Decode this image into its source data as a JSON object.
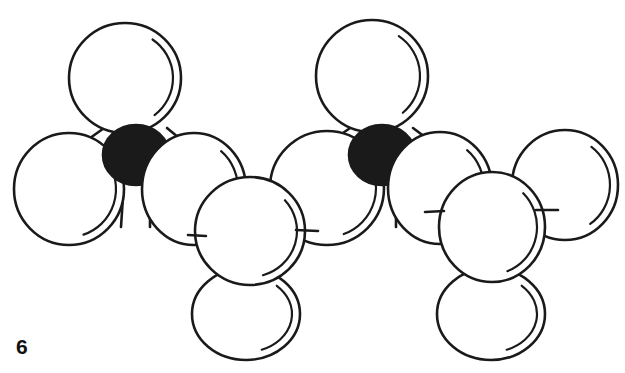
{
  "figure": {
    "label": "6",
    "caption": "",
    "background_color": "#ffffff",
    "outline_color": "#1a1a1a",
    "sphere_fill_color": "#ffffff",
    "carbon_fill_color": "#1a1a1a",
    "outline_width": 2.6,
    "highlight_color": "#1a1a1a"
  },
  "molecule": {
    "name": "space-filling model",
    "atom_count": 12,
    "carbon_count": 2,
    "hydrogen_count": 10,
    "atoms": [
      {
        "id": "h-top-left",
        "element": "H",
        "kind": "sphere",
        "cx": 125,
        "cy": 78,
        "rx": 56,
        "ry": 55,
        "z": 6,
        "fill": "#ffffff",
        "highlight": {
          "a0": -55,
          "a1": 52,
          "inset": 8
        }
      },
      {
        "id": "h-far-left",
        "element": "H",
        "kind": "sphere",
        "cx": 69,
        "cy": 189,
        "rx": 55,
        "ry": 56,
        "z": 5,
        "fill": "#ffffff",
        "highlight": {
          "a0": -36,
          "a1": 72,
          "inset": 8
        }
      },
      {
        "id": "c-left",
        "element": "C",
        "kind": "carbon",
        "cx": 136,
        "cy": 155,
        "rx": 33,
        "ry": 30,
        "z": 7,
        "fill": "#1a1a1a",
        "highlight": null
      },
      {
        "id": "h-left-inner",
        "element": "H",
        "kind": "sphere",
        "cx": 194,
        "cy": 189,
        "rx": 52,
        "ry": 56,
        "z": 8,
        "fill": "#ffffff",
        "highlight": {
          "a0": -52,
          "a1": 66,
          "inset": 8
        }
      },
      {
        "id": "h-front-left",
        "element": "H",
        "kind": "sphere",
        "cx": 250,
        "cy": 231,
        "rx": 55,
        "ry": 54,
        "z": 10,
        "fill": "#ffffff",
        "highlight": {
          "a0": -42,
          "a1": 74,
          "inset": 8
        }
      },
      {
        "id": "h-bottom-left",
        "element": "H",
        "kind": "sphere",
        "cx": 246,
        "cy": 314,
        "rx": 54,
        "ry": 46,
        "z": 9,
        "fill": "#ffffff",
        "highlight": {
          "a0": -48,
          "a1": 70,
          "inset": 8
        }
      },
      {
        "id": "h-mid",
        "element": "H",
        "kind": "sphere",
        "cx": 327,
        "cy": 188,
        "rx": 57,
        "ry": 57,
        "z": 6,
        "fill": "#ffffff",
        "highlight": {
          "a0": -40,
          "a1": 70,
          "inset": 8
        }
      },
      {
        "id": "h-top-right",
        "element": "H",
        "kind": "sphere",
        "cx": 372,
        "cy": 76,
        "rx": 56,
        "ry": 56,
        "z": 6,
        "fill": "#ffffff",
        "highlight": {
          "a0": -56,
          "a1": 50,
          "inset": 8
        }
      },
      {
        "id": "c-right",
        "element": "C",
        "kind": "carbon",
        "cx": 382,
        "cy": 155,
        "rx": 33,
        "ry": 30,
        "z": 7,
        "fill": "#1a1a1a",
        "highlight": null
      },
      {
        "id": "h-right-inner",
        "element": "H",
        "kind": "sphere",
        "cx": 440,
        "cy": 188,
        "rx": 52,
        "ry": 56,
        "z": 8,
        "fill": "#ffffff",
        "highlight": {
          "a0": -52,
          "a1": 66,
          "inset": 8
        }
      },
      {
        "id": "h-far-right",
        "element": "H",
        "kind": "sphere",
        "cx": 565,
        "cy": 185,
        "rx": 53,
        "ry": 55,
        "z": 7,
        "fill": "#ffffff",
        "highlight": {
          "a0": -54,
          "a1": 56,
          "inset": 8
        }
      },
      {
        "id": "h-front-right",
        "element": "H",
        "kind": "sphere",
        "cx": 492,
        "cy": 227,
        "rx": 53,
        "ry": 55,
        "z": 10,
        "fill": "#ffffff",
        "highlight": {
          "a0": -46,
          "a1": 70,
          "inset": 8
        }
      },
      {
        "id": "h-bottom-right",
        "element": "H",
        "kind": "sphere",
        "cx": 491,
        "cy": 314,
        "rx": 54,
        "ry": 46,
        "z": 9,
        "fill": "#ffffff",
        "highlight": {
          "a0": -48,
          "a1": 70,
          "inset": 8
        }
      }
    ],
    "bond_collars": [
      {
        "id": "collar-left-top-a",
        "x1": 83,
        "y1": 143,
        "x2": 107,
        "y2": 126
      },
      {
        "id": "collar-left-top-b",
        "x1": 167,
        "y1": 128,
        "x2": 190,
        "y2": 147
      },
      {
        "id": "collar-left-bottom-a",
        "x1": 124,
        "y1": 181,
        "x2": 121,
        "y2": 227
      },
      {
        "id": "collar-left-bottom-b",
        "x1": 150,
        "y1": 181,
        "x2": 150,
        "y2": 227
      },
      {
        "id": "collar-right-top-a",
        "x1": 330,
        "y1": 142,
        "x2": 353,
        "y2": 126
      },
      {
        "id": "collar-right-top-b",
        "x1": 413,
        "y1": 128,
        "x2": 437,
        "y2": 146
      },
      {
        "id": "collar-right-bottom-a",
        "x1": 371,
        "y1": 181,
        "x2": 368,
        "y2": 227
      },
      {
        "id": "collar-right-bottom-b",
        "x1": 396,
        "y1": 181,
        "x2": 396,
        "y2": 227
      }
    ],
    "contact_seams": [
      {
        "id": "seam-mid-front-left",
        "x1": 188,
        "y1": 235,
        "x2": 206,
        "y2": 236
      },
      {
        "id": "seam-front-left-right",
        "x1": 296,
        "y1": 230,
        "x2": 318,
        "y2": 231
      },
      {
        "id": "seam-right-inner-front",
        "x1": 425,
        "y1": 212,
        "x2": 444,
        "y2": 211
      },
      {
        "id": "seam-front-right-far",
        "x1": 536,
        "y1": 210,
        "x2": 558,
        "y2": 210
      }
    ]
  }
}
